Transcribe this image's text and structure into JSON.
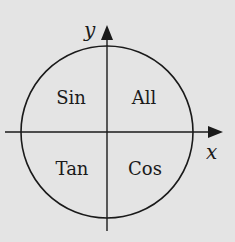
{
  "diagram": {
    "axes": {
      "x_label": "x",
      "y_label": "y"
    },
    "quadrants": {
      "q1": "All",
      "q2": "Sin",
      "q3": "Tan",
      "q4": "Cos"
    },
    "colors": {
      "background": "#e4e4e4",
      "stroke": "#1a1a1a"
    }
  }
}
